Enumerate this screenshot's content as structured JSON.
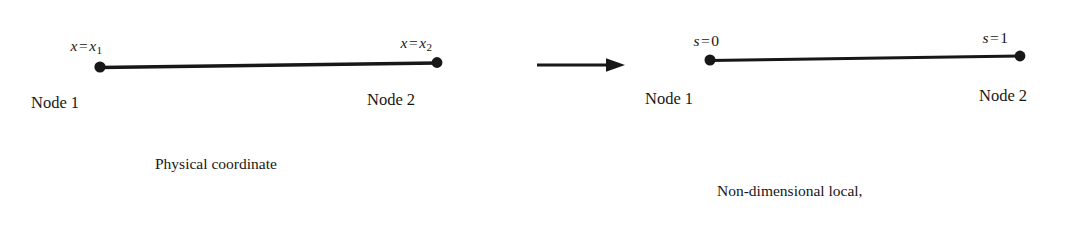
{
  "figure": {
    "background_color": "#ffffff",
    "ink_color": "#171717"
  },
  "left_diagram": {
    "name": "physical-coordinate-element",
    "node1_coord": {
      "var": "x",
      "equals": "=",
      "value_var": "x",
      "value_sub": "1",
      "full": "x = x1"
    },
    "node2_coord": {
      "var": "x",
      "equals": "=",
      "value_var": "x",
      "value_sub": "2",
      "full": "x = x2"
    },
    "node1_label": "Node 1",
    "node2_label": "Node 2",
    "caption": "Physical coordinate"
  },
  "arrow": {
    "name": "mapping-arrow",
    "direction": "right"
  },
  "right_diagram": {
    "name": "parent-coordinate-element",
    "node1_coord": {
      "var": "s",
      "equals": "=",
      "value": "0",
      "full": "s = 0"
    },
    "node2_coord": {
      "var": "s",
      "equals": "=",
      "value": "1",
      "full": "s = 1"
    },
    "node1_label": "Node 1",
    "node2_label": "Node 2",
    "caption_lines": [
      "Non-dimensional local,",
      "element, or parent",
      "coordinate"
    ]
  }
}
